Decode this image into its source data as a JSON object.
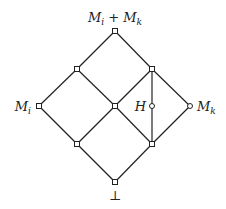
{
  "diagram": {
    "type": "lattice (Hasse diagram)",
    "colors": {
      "line": "#222222",
      "node_fill": "#ffffff",
      "background": "#ffffff"
    },
    "labels": {
      "top": {
        "base": "M",
        "sub": "i",
        "op": " + ",
        "base2": "M",
        "sub2": "k"
      },
      "left": {
        "base": "M",
        "sub": "i"
      },
      "right": {
        "base": "M",
        "sub": "k"
      },
      "h": "H",
      "bottom": "⊥"
    },
    "nodes": [
      {
        "id": "top",
        "label": "M_i + M_k",
        "x": 115,
        "y": 31
      },
      {
        "id": "upper-left",
        "label": "",
        "x": 77,
        "y": 69
      },
      {
        "id": "upper-right",
        "label": "",
        "x": 152,
        "y": 69
      },
      {
        "id": "mi",
        "label": "M_i",
        "x": 39,
        "y": 106
      },
      {
        "id": "center",
        "label": "",
        "x": 115,
        "y": 106
      },
      {
        "id": "h",
        "label": "H",
        "x": 152,
        "y": 106
      },
      {
        "id": "mk",
        "label": "M_k",
        "x": 190,
        "y": 106
      },
      {
        "id": "lower-left",
        "label": "",
        "x": 77,
        "y": 144
      },
      {
        "id": "lower-right",
        "label": "",
        "x": 152,
        "y": 144
      },
      {
        "id": "bottom",
        "label": "⊥",
        "x": 115,
        "y": 182
      }
    ],
    "edges": [
      [
        "top",
        "upper-left"
      ],
      [
        "top",
        "upper-right"
      ],
      [
        "upper-left",
        "mi"
      ],
      [
        "upper-left",
        "center"
      ],
      [
        "upper-right",
        "center"
      ],
      [
        "upper-right",
        "mk"
      ],
      [
        "upper-right",
        "h"
      ],
      [
        "h",
        "lower-right"
      ],
      [
        "mi",
        "lower-left"
      ],
      [
        "center",
        "lower-left"
      ],
      [
        "center",
        "lower-right"
      ],
      [
        "mk",
        "lower-right"
      ],
      [
        "lower-left",
        "bottom"
      ],
      [
        "lower-right",
        "bottom"
      ]
    ]
  }
}
